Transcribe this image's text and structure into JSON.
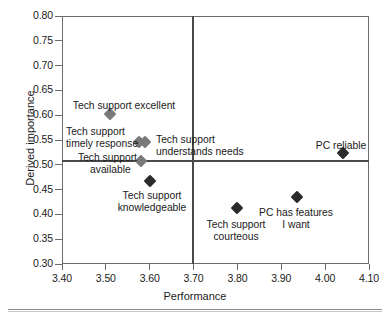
{
  "chart_data": {
    "type": "scatter",
    "title": "",
    "xlabel": "Performance",
    "ylabel": "Derived importance",
    "xlim": [
      3.4,
      4.1
    ],
    "ylim": [
      0.3,
      0.8
    ],
    "xticks": [
      "3.40",
      "3.50",
      "3.60",
      "3.70",
      "3.80",
      "3.90",
      "4.00",
      "4.10"
    ],
    "yticks": [
      "0.80",
      "0.75",
      "0.70",
      "0.65",
      "0.60",
      "0.55",
      "0.50",
      "0.45",
      "0.40",
      "0.35",
      "0.30"
    ],
    "grid": false,
    "legend": "none",
    "reference_lines": {
      "vertical_x": 3.7,
      "horizontal_y": 0.505
    },
    "marker_shape": "diamond",
    "marker_color": "#2b2b2b",
    "points": [
      {
        "label": "Tech support excellent",
        "x": 3.51,
        "y": 0.602,
        "marker_color": "#7a7a7a"
      },
      {
        "label": "Tech support\ntimely response",
        "x": 3.575,
        "y": 0.545,
        "marker_color": "#7a7a7a"
      },
      {
        "label": "Tech support\nunderstands needs",
        "x": 3.59,
        "y": 0.545,
        "marker_color": "#7a7a7a"
      },
      {
        "label": "Tech support\navailable",
        "x": 3.58,
        "y": 0.508,
        "marker_color": "#7a7a7a"
      },
      {
        "label": "Tech support\nknowledgeable",
        "x": 3.6,
        "y": 0.468,
        "marker_color": "#2b2b2b"
      },
      {
        "label": "Tech support\ncourteous",
        "x": 3.8,
        "y": 0.412,
        "marker_color": "#2b2b2b"
      },
      {
        "label": "PC has features\nI want",
        "x": 3.935,
        "y": 0.435,
        "marker_color": "#2b2b2b"
      },
      {
        "label": "PC reliable",
        "x": 4.04,
        "y": 0.523,
        "marker_color": "#2b2b2b"
      }
    ],
    "labels": [
      {
        "text": "Tech support excellent",
        "px": 124,
        "py": 100,
        "align": "center"
      },
      {
        "text": "Tech support",
        "px": 66,
        "py": 126,
        "align": "left"
      },
      {
        "text": "timely response",
        "px": 66,
        "py": 138,
        "align": "left"
      },
      {
        "text": "Tech support",
        "px": 156,
        "py": 134,
        "align": "left"
      },
      {
        "text": "understands needs",
        "px": 156,
        "py": 146,
        "align": "left"
      },
      {
        "text": "Tech support",
        "px": 78,
        "py": 152,
        "align": "left"
      },
      {
        "text": "available",
        "px": 90,
        "py": 164,
        "align": "left"
      },
      {
        "text": "Tech support",
        "px": 152,
        "py": 190,
        "align": "center"
      },
      {
        "text": "knowledgeable",
        "px": 152,
        "py": 202,
        "align": "center"
      },
      {
        "text": "Tech support",
        "px": 236,
        "py": 219,
        "align": "center"
      },
      {
        "text": "courteous",
        "px": 236,
        "py": 231,
        "align": "center"
      },
      {
        "text": "PC has features",
        "px": 296,
        "py": 207,
        "align": "center"
      },
      {
        "text": "I want",
        "px": 296,
        "py": 219,
        "align": "center"
      },
      {
        "text": "PC reliable",
        "px": 341,
        "py": 140,
        "align": "center"
      }
    ]
  }
}
